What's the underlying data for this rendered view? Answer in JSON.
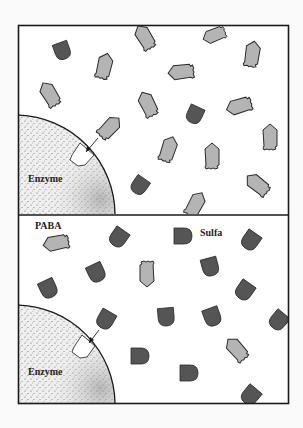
{
  "figure": {
    "panels": [
      {
        "id": "top",
        "description": "PABA molecules binding to enzyme active site",
        "enzyme_label": "Enzyme"
      },
      {
        "id": "bottom",
        "description": "Sulfa molecules competing for enzyme active site",
        "enzyme_label": "Enzyme",
        "legend": [
          "PABA",
          "Sulfa"
        ]
      }
    ],
    "labels": {
      "enzyme_top": "Enzyme",
      "enzyme_bottom": "Enzyme",
      "paba": "PABA",
      "sulfa": "Sulfa"
    },
    "colors": {
      "paba": "#b4b4b4",
      "sulfa": "#555555",
      "outline": "#2a2a2a",
      "background": "#ffffff",
      "frame": "#1a1a1a"
    }
  }
}
